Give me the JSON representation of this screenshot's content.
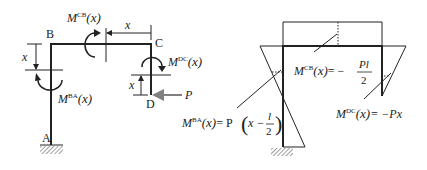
{
  "left_diagram": {
    "points": {
      "A": "A",
      "B": "B",
      "C": "C",
      "D": "D"
    },
    "load": "P",
    "dim_label": "x",
    "moments": {
      "ba": {
        "M": "M",
        "sup": "BA",
        "arg": "(x)"
      },
      "cb": {
        "M": "M",
        "sup": "CB",
        "arg": "(x)"
      },
      "dc": {
        "M": "M",
        "sup": "DC",
        "arg": "(x)"
      }
    }
  },
  "right_diagram": {
    "eq_ba": {
      "lhs_M": "M",
      "lhs_sup": "BA",
      "lhs_arg": "(x)",
      "rhs": "= P",
      "lparen": "(",
      "var": "x −",
      "num": "l",
      "den": "2",
      "rparen": ")"
    },
    "eq_cb": {
      "lhs_M": "M",
      "lhs_sup": "CB",
      "lhs_arg": "(x)",
      "rhs": "= −",
      "num": "Pl",
      "den": "2"
    },
    "eq_dc": {
      "lhs_M": "M",
      "lhs_sup": "DC",
      "lhs_arg": "(x)",
      "rhs": "= −Px"
    }
  },
  "colors": {
    "line": "#222222",
    "arrow_fill": "#808080"
  }
}
